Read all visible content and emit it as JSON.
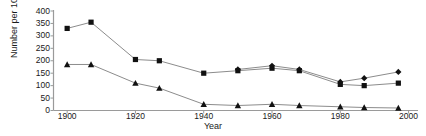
{
  "chart_data": {
    "type": "line",
    "title": "",
    "xlabel": "Year",
    "ylabel": "Number per 1000",
    "xlim": [
      1896,
      2001
    ],
    "ylim": [
      0,
      400
    ],
    "xticks": [
      1900,
      1920,
      1940,
      1960,
      1980,
      2000
    ],
    "yticks": [
      0,
      50,
      100,
      150,
      200,
      250,
      300,
      350,
      400
    ],
    "grid": false,
    "legend": "none",
    "series": [
      {
        "name": "series-squares",
        "marker": "square",
        "x": [
          1900,
          1907,
          1920,
          1927,
          1940,
          1950,
          1960,
          1968,
          1980,
          1987,
          1997
        ],
        "values": [
          330,
          355,
          205,
          200,
          150,
          160,
          170,
          160,
          105,
          100,
          110
        ]
      },
      {
        "name": "series-diamonds",
        "marker": "diamond",
        "x": [
          1950,
          1960,
          1968,
          1980,
          1987,
          1997
        ],
        "values": [
          165,
          180,
          165,
          115,
          130,
          155
        ]
      },
      {
        "name": "series-triangles",
        "marker": "triangle",
        "x": [
          1900,
          1907,
          1920,
          1927,
          1940,
          1950,
          1960,
          1968,
          1980,
          1987,
          1997
        ],
        "values": [
          185,
          185,
          110,
          90,
          25,
          20,
          25,
          20,
          15,
          12,
          10
        ]
      }
    ]
  },
  "axis": {
    "ylabel": "Number per 1000",
    "xlabel": "Year",
    "ytick_labels": [
      "0",
      "50",
      "100",
      "150",
      "200",
      "250",
      "300",
      "350",
      "400"
    ],
    "xtick_labels": [
      "1900",
      "1920",
      "1940",
      "1960",
      "1980",
      "2000"
    ]
  },
  "colors": {
    "line": "#8c8c8c",
    "marker": "#111111",
    "axis": "#9a9a9a",
    "text": "#1a1a1a",
    "background": "#ffffff"
  }
}
